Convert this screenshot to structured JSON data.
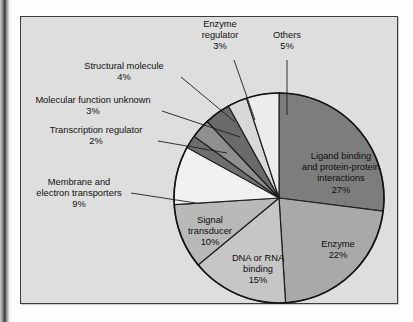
{
  "figure": {
    "kind": "pie-chart-figure",
    "panel_background": "#dedede",
    "panel_border": "#3b3b3b"
  },
  "chart_data": {
    "type": "pie",
    "title": "",
    "subtitle": "",
    "xlabel": "",
    "ylabel": "",
    "legend_position": "none",
    "grid": false,
    "units": "percent",
    "total": 100,
    "start_angle_deg": 0,
    "direction": "clockwise",
    "categories": [
      "Ligand binding and protein-protein interactions",
      "Enzyme",
      "DNA or RNA binding",
      "Signal transducer",
      "Membrane and electron transporters",
      "Transcription regulator",
      "Molecular function unknown",
      "Structural molecule",
      "Enzyme regulator",
      "Others"
    ],
    "values": [
      27,
      22,
      15,
      10,
      9,
      2,
      3,
      4,
      3,
      5
    ],
    "colors": [
      "#7d7d7d",
      "#a9a9a9",
      "#c6c6c6",
      "#b9b9b9",
      "#f1f1f1",
      "#6e6e6e",
      "#8f8f8f",
      "#6a6a6a",
      "#d8d8d8",
      "#ececec"
    ],
    "slices": [
      {
        "label": "Ligand binding and protein-protein interactions",
        "value": 27,
        "display": "27%",
        "color": "#7d7d7d",
        "label_placement": "inside"
      },
      {
        "label": "Enzyme",
        "value": 22,
        "display": "22%",
        "color": "#a9a9a9",
        "label_placement": "inside"
      },
      {
        "label": "DNA or RNA binding",
        "value": 15,
        "display": "15%",
        "color": "#c6c6c6",
        "label_placement": "inside"
      },
      {
        "label": "Signal transducer",
        "value": 10,
        "display": "10%",
        "color": "#b9b9b9",
        "label_placement": "inside"
      },
      {
        "label": "Membrane and electron transporters",
        "value": 9,
        "display": "9%",
        "color": "#f1f1f1",
        "label_placement": "callout"
      },
      {
        "label": "Transcription regulator",
        "value": 2,
        "display": "2%",
        "color": "#6e6e6e",
        "label_placement": "callout"
      },
      {
        "label": "Molecular function unknown",
        "value": 3,
        "display": "3%",
        "color": "#8f8f8f",
        "label_placement": "callout"
      },
      {
        "label": "Structural molecule",
        "value": 4,
        "display": "4%",
        "color": "#6a6a6a",
        "label_placement": "callout"
      },
      {
        "label": "Enzyme regulator",
        "value": 3,
        "display": "3%",
        "color": "#d8d8d8",
        "label_placement": "callout"
      },
      {
        "label": "Others",
        "value": 5,
        "display": "5%",
        "color": "#ececec",
        "label_placement": "callout"
      }
    ]
  },
  "labels": {
    "enzyme_regulator": {
      "line1": "Enzyme",
      "line2": "regulator",
      "pct": "3%"
    },
    "others": {
      "line1": "Others",
      "pct": "5%"
    },
    "structural_molecule": {
      "line1": "Structural molecule",
      "pct": "4%"
    },
    "molecular_function_unknown": {
      "line1": "Molecular function unknown",
      "pct": "3%"
    },
    "transcription_regulator": {
      "line1": "Transcription regulator",
      "pct": "2%"
    },
    "membrane_transporters": {
      "line1": "Membrane and",
      "line2": "electron transporters",
      "pct": "9%"
    },
    "ligand_binding": {
      "line1": "Ligand binding",
      "line2": "and protein-protein",
      "line3": "interactions",
      "pct": "27%"
    },
    "enzyme": {
      "line1": "Enzyme",
      "pct": "22%"
    },
    "dna_rna_binding": {
      "line1": "DNA or RNA",
      "line2": "binding",
      "pct": "15%"
    },
    "signal_transducer": {
      "line1": "Signal",
      "line2": "transducer",
      "pct": "10%"
    }
  }
}
